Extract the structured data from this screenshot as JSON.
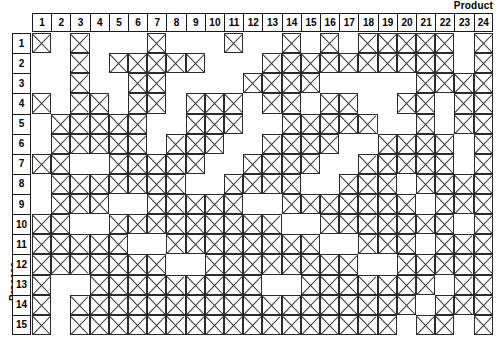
{
  "axis": {
    "column_axis_label": "Product",
    "row_axis_label": "Process"
  },
  "chart_data": {
    "type": "heatmap",
    "title": "",
    "subtitle": "",
    "xlabel": "Product",
    "ylabel": "Process",
    "grid": true,
    "legend": "none",
    "cell_marker": "X",
    "columns": [
      "1",
      "2",
      "3",
      "4",
      "5",
      "6",
      "7",
      "8",
      "9",
      "10",
      "11",
      "12",
      "13",
      "14",
      "15",
      "16",
      "17",
      "18",
      "19",
      "20",
      "21",
      "22",
      "23",
      "24"
    ],
    "rows": [
      "1",
      "2",
      "3",
      "4",
      "5",
      "6",
      "7",
      "8",
      "9",
      "10",
      "11",
      "12",
      "13",
      "14",
      "15"
    ],
    "n_rows": 15,
    "n_columns": 24,
    "values": [
      [
        1,
        0,
        1,
        0,
        0,
        0,
        1,
        0,
        0,
        0,
        1,
        0,
        0,
        1,
        0,
        1,
        0,
        1,
        1,
        1,
        1,
        1,
        0,
        1
      ],
      [
        0,
        0,
        1,
        0,
        1,
        1,
        1,
        1,
        1,
        0,
        0,
        0,
        1,
        1,
        1,
        1,
        1,
        1,
        1,
        1,
        1,
        1,
        0,
        1
      ],
      [
        0,
        0,
        1,
        0,
        0,
        1,
        1,
        0,
        0,
        0,
        0,
        1,
        1,
        1,
        1,
        0,
        0,
        0,
        0,
        0,
        1,
        1,
        1,
        1
      ],
      [
        1,
        0,
        1,
        1,
        0,
        1,
        1,
        0,
        1,
        1,
        1,
        0,
        1,
        1,
        0,
        1,
        1,
        0,
        0,
        1,
        1,
        0,
        1,
        1
      ],
      [
        0,
        1,
        1,
        1,
        1,
        1,
        0,
        0,
        1,
        1,
        1,
        0,
        0,
        1,
        1,
        1,
        1,
        1,
        0,
        0,
        1,
        0,
        1,
        1
      ],
      [
        0,
        1,
        1,
        1,
        1,
        1,
        0,
        1,
        1,
        1,
        0,
        0,
        1,
        1,
        1,
        1,
        0,
        0,
        1,
        1,
        1,
        1,
        0,
        1
      ],
      [
        1,
        1,
        0,
        0,
        1,
        1,
        1,
        1,
        1,
        0,
        0,
        1,
        1,
        1,
        1,
        0,
        0,
        1,
        1,
        1,
        1,
        1,
        0,
        1
      ],
      [
        0,
        1,
        1,
        1,
        1,
        1,
        1,
        1,
        0,
        0,
        1,
        1,
        1,
        1,
        0,
        0,
        1,
        1,
        1,
        0,
        1,
        1,
        1,
        1
      ],
      [
        0,
        1,
        1,
        1,
        0,
        0,
        1,
        1,
        1,
        1,
        1,
        0,
        0,
        1,
        1,
        1,
        1,
        1,
        1,
        1,
        0,
        1,
        1,
        1
      ],
      [
        1,
        1,
        0,
        0,
        1,
        1,
        1,
        1,
        1,
        1,
        1,
        1,
        1,
        0,
        0,
        1,
        1,
        1,
        1,
        1,
        1,
        1,
        0,
        1
      ],
      [
        1,
        1,
        1,
        1,
        1,
        0,
        0,
        1,
        1,
        1,
        1,
        1,
        1,
        1,
        1,
        0,
        0,
        1,
        1,
        1,
        0,
        1,
        1,
        1
      ],
      [
        1,
        1,
        1,
        1,
        1,
        1,
        1,
        0,
        0,
        1,
        1,
        1,
        1,
        1,
        1,
        1,
        1,
        0,
        0,
        1,
        1,
        1,
        1,
        1
      ],
      [
        1,
        0,
        0,
        1,
        1,
        1,
        1,
        1,
        1,
        1,
        1,
        1,
        0,
        0,
        1,
        1,
        1,
        1,
        1,
        1,
        1,
        0,
        1,
        1
      ],
      [
        1,
        0,
        1,
        1,
        1,
        1,
        1,
        1,
        1,
        1,
        1,
        1,
        1,
        1,
        1,
        1,
        1,
        1,
        1,
        1,
        0,
        1,
        1,
        1
      ],
      [
        1,
        0,
        1,
        1,
        1,
        1,
        1,
        1,
        1,
        1,
        1,
        1,
        1,
        1,
        1,
        1,
        1,
        1,
        1,
        0,
        1,
        1,
        0,
        1
      ]
    ]
  },
  "style": {
    "cell_border_color": "#2b2b2b",
    "header_border_color": "#1a1a1a",
    "background": "#ffffff",
    "text_color": "#000000"
  }
}
